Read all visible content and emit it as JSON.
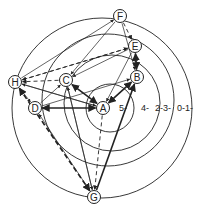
{
  "diagram": {
    "title": "",
    "ring_labels": [
      "5-",
      "4-",
      "2-3-",
      "0-1-"
    ],
    "nodes": [
      {
        "id": "A",
        "label": "A"
      },
      {
        "id": "B",
        "label": "B"
      },
      {
        "id": "C",
        "label": "C"
      },
      {
        "id": "D",
        "label": "D"
      },
      {
        "id": "E",
        "label": "E"
      },
      {
        "id": "F",
        "label": "F"
      },
      {
        "id": "G",
        "label": "G"
      },
      {
        "id": "H",
        "label": "H"
      }
    ],
    "edges": [
      {
        "from": "C",
        "to": "A",
        "style": "bold",
        "bidirectional": true
      },
      {
        "from": "B",
        "to": "A",
        "style": "bold",
        "bidirectional": true
      },
      {
        "from": "D",
        "to": "A",
        "style": "bold",
        "bidirectional": true
      },
      {
        "from": "E",
        "to": "B",
        "style": "bold",
        "bidirectional": true
      },
      {
        "from": "G",
        "to": "B",
        "style": "bold",
        "bidirectional": false
      },
      {
        "from": "H",
        "to": "G",
        "style": "bold-dashed",
        "bidirectional": true
      },
      {
        "from": "A",
        "to": "G",
        "style": "dashed",
        "bidirectional": false
      },
      {
        "from": "F",
        "to": "E",
        "style": "dashed",
        "bidirectional": false
      },
      {
        "from": "H",
        "to": "E",
        "style": "dashed",
        "bidirectional": false
      },
      {
        "from": "C",
        "to": "H",
        "style": "dashed",
        "bidirectional": false
      },
      {
        "from": "E",
        "to": "H",
        "style": "dashed",
        "bidirectional": false
      },
      {
        "from": "F",
        "to": "B",
        "style": "thin",
        "bidirectional": false
      },
      {
        "from": "H",
        "to": "F",
        "style": "thin",
        "bidirectional": false
      },
      {
        "from": "F",
        "to": "C",
        "style": "thin",
        "bidirectional": false
      },
      {
        "from": "E",
        "to": "C",
        "style": "thin",
        "bidirectional": false
      },
      {
        "from": "E",
        "to": "A",
        "style": "thin",
        "bidirectional": false
      },
      {
        "from": "H",
        "to": "A",
        "style": "thin",
        "bidirectional": false
      },
      {
        "from": "A",
        "to": "H",
        "style": "thin",
        "bidirectional": false
      },
      {
        "from": "D",
        "to": "C",
        "style": "thin",
        "bidirectional": false
      },
      {
        "from": "D",
        "to": "B",
        "style": "thin",
        "bidirectional": false
      },
      {
        "from": "D",
        "to": "G",
        "style": "thin",
        "bidirectional": true
      },
      {
        "from": "C",
        "to": "G",
        "style": "thin",
        "bidirectional": false
      },
      {
        "from": "G",
        "to": "C",
        "style": "thin",
        "bidirectional": false
      },
      {
        "from": "H",
        "to": "D",
        "style": "thin",
        "bidirectional": false
      }
    ]
  }
}
